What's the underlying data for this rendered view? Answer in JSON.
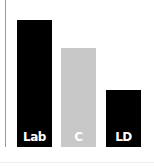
{
  "chart_data": {
    "type": "bar",
    "title": "",
    "xlabel": "",
    "ylabel": "",
    "categories": [
      "Lab",
      "C",
      "LD"
    ],
    "values": [
      100,
      78,
      45
    ],
    "colors": [
      "#000000",
      "#c8c8c8",
      "#000000"
    ],
    "ylim": [
      0,
      100
    ],
    "grid": false,
    "legend": null,
    "labels_inside_bars": true
  }
}
